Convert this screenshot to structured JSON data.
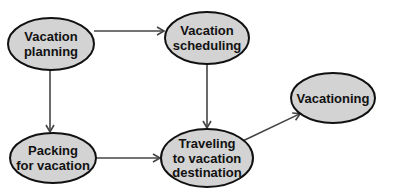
{
  "diagram": {
    "type": "flowchart",
    "colors": {
      "node_fill": "#d3d3d3",
      "node_stroke": "#111111",
      "edge": "#444444"
    },
    "nodes": [
      {
        "id": "planning",
        "lines": [
          "Vacation",
          "planning"
        ]
      },
      {
        "id": "scheduling",
        "lines": [
          "Vacation",
          "scheduling"
        ]
      },
      {
        "id": "vacationing",
        "lines": [
          "Vacationing"
        ]
      },
      {
        "id": "packing",
        "lines": [
          "Packing",
          "for vacation"
        ]
      },
      {
        "id": "traveling",
        "lines": [
          "Traveling",
          "to vacation",
          "destination"
        ]
      }
    ],
    "edges": [
      {
        "from": "planning",
        "to": "scheduling"
      },
      {
        "from": "planning",
        "to": "packing"
      },
      {
        "from": "scheduling",
        "to": "traveling"
      },
      {
        "from": "packing",
        "to": "traveling"
      },
      {
        "from": "traveling",
        "to": "vacationing"
      }
    ]
  }
}
